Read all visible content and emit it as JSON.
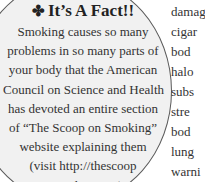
{
  "sidebar": {
    "icon": "club-bullet-icon",
    "icon_glyph": "✤",
    "title": "It’s A Fact!!",
    "lines": [
      "Smoking causes so many",
      "problems in so many parts of",
      "your body that  the American",
      "Council on Science and Health",
      "has devoted an entire section",
      "of “The Scoop on Smoking”",
      "website explaining them",
      "(visit http://thescoop",
      "onsmoking.org)."
    ]
  },
  "main_text": {
    "line_fragments": [
      "damag",
      "cigar",
      "bod",
      "halo",
      "subs",
      "stre",
      "bod",
      "lung",
      "warni"
    ]
  },
  "colors": {
    "sidebar_fill": "#f1f1f1",
    "sidebar_border": "#5a5a5a",
    "text": "#333333"
  }
}
